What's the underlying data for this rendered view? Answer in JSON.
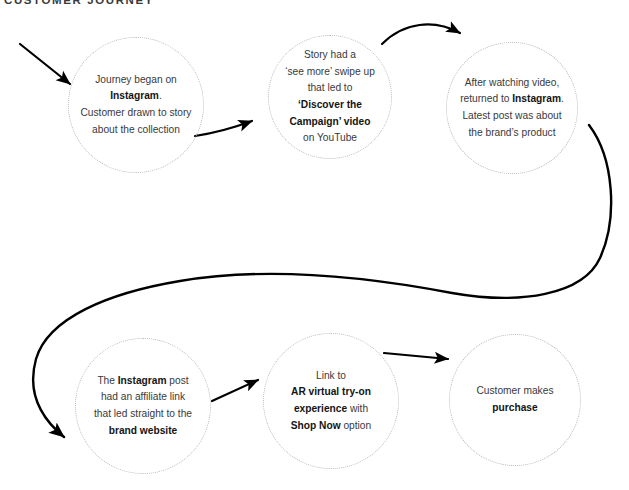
{
  "diagram": {
    "title": "CUSTOMER JOURNEY",
    "type": "flow-diagram",
    "accent_color": "#000000",
    "node_border_color": "#b9b9b9",
    "text_color": "#39393b",
    "nodes": [
      {
        "id": "node-1",
        "name": "journey-began-instagram",
        "row": "top",
        "position": 1,
        "cx": 136,
        "cy": 105,
        "r": 68,
        "lines": [
          [
            {
              "t": "Journey began on",
              "b": false
            }
          ],
          [
            {
              "t": "Instagram",
              "b": true
            },
            {
              "t": ".",
              "b": false
            }
          ],
          [
            {
              "t": "Customer drawn to story",
              "b": false
            }
          ],
          [
            {
              "t": "about the collection",
              "b": false
            }
          ]
        ]
      },
      {
        "id": "node-2",
        "name": "story-see-more-swipe-up",
        "row": "top",
        "position": 2,
        "cx": 330,
        "cy": 97,
        "r": 62,
        "lines": [
          [
            {
              "t": "Story had a",
              "b": false
            }
          ],
          [
            {
              "t": "‘see more’ swipe up",
              "b": false
            }
          ],
          [
            {
              "t": "that led to",
              "b": false
            }
          ],
          [
            {
              "t": "‘Discover the",
              "b": true
            }
          ],
          [
            {
              "t": "Campaign’ video",
              "b": true
            }
          ],
          [
            {
              "t": "on YouTube",
              "b": false
            }
          ]
        ]
      },
      {
        "id": "node-3",
        "name": "returned-to-instagram",
        "row": "top",
        "position": 3,
        "cx": 512,
        "cy": 108,
        "r": 66,
        "lines": [
          [
            {
              "t": "After watching video,",
              "b": false
            }
          ],
          [
            {
              "t": "returned to ",
              "b": false
            },
            {
              "t": "Instagram",
              "b": true
            },
            {
              "t": ".",
              "b": false
            }
          ],
          [
            {
              "t": "Latest post was about",
              "b": false
            }
          ],
          [
            {
              "t": "the brand’s product",
              "b": false
            }
          ]
        ]
      },
      {
        "id": "node-4",
        "name": "instagram-post-affiliate-link",
        "row": "bottom",
        "position": 1,
        "cx": 143,
        "cy": 406,
        "r": 68,
        "lines": [
          [
            {
              "t": "The ",
              "b": false
            },
            {
              "t": "Instagram",
              "b": true
            },
            {
              "t": " post",
              "b": false
            }
          ],
          [
            {
              "t": "had an affiliate link",
              "b": false
            }
          ],
          [
            {
              "t": "that led straight to the",
              "b": false
            }
          ],
          [
            {
              "t": "brand website",
              "b": true
            }
          ]
        ]
      },
      {
        "id": "node-5",
        "name": "ar-virtual-tryon-shop-now",
        "row": "bottom",
        "position": 2,
        "cx": 331,
        "cy": 401,
        "r": 68,
        "lines": [
          [
            {
              "t": "Link to",
              "b": false
            }
          ],
          [
            {
              "t": "AR virtual try-on",
              "b": true
            }
          ],
          [
            {
              "t": "experience",
              "b": true
            },
            {
              "t": " with",
              "b": false
            }
          ],
          [
            {
              "t": "Shop Now",
              "b": true
            },
            {
              "t": " option",
              "b": false
            }
          ]
        ]
      },
      {
        "id": "node-6",
        "name": "customer-makes-purchase",
        "row": "bottom",
        "position": 3,
        "cx": 515,
        "cy": 400,
        "r": 66,
        "lines": [
          [
            {
              "t": "Customer makes",
              "b": false
            }
          ],
          [
            {
              "t": "purchase",
              "b": true
            }
          ]
        ]
      }
    ],
    "connectors": [
      {
        "id": "arrow-entry",
        "name": "entry-arrow",
        "from": "start",
        "to": "node-1",
        "style": "straight-diagonal"
      },
      {
        "id": "arrow-1-2",
        "name": "arrow-node1-to-node2",
        "from": "node-1",
        "to": "node-2",
        "style": "slight-curve-up"
      },
      {
        "id": "arrow-2-3",
        "name": "arrow-node2-to-node3",
        "from": "node-2",
        "to": "node-3",
        "style": "arc-over-top"
      },
      {
        "id": "arrow-3-4",
        "name": "arrow-node3-to-node4",
        "from": "node-3",
        "to": "node-4",
        "style": "long-s-curve"
      },
      {
        "id": "arrow-4-5",
        "name": "arrow-node4-to-node5",
        "from": "node-4",
        "to": "node-5",
        "style": "straight-diagonal"
      },
      {
        "id": "arrow-5-6",
        "name": "arrow-node5-to-node6",
        "from": "node-5",
        "to": "node-6",
        "style": "straight-horizontal"
      }
    ]
  }
}
